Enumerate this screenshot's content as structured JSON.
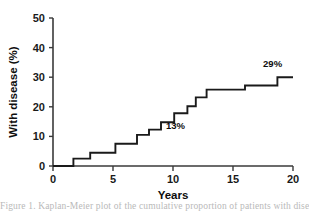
{
  "chart_data": {
    "type": "line",
    "subtype": "step",
    "title": "",
    "xlabel": "Years",
    "ylabel": "With disease (%)",
    "xlim": [
      0,
      20
    ],
    "ylim": [
      0,
      50
    ],
    "xticks": [
      0,
      5,
      10,
      15,
      20
    ],
    "yticks": [
      0,
      10,
      20,
      30,
      40,
      50
    ],
    "xtick_labels": [
      "0",
      "5",
      "10",
      "15",
      "20"
    ],
    "ytick_labels": [
      "0",
      "10",
      "20",
      "30",
      "40",
      "50"
    ],
    "grid": false,
    "legend": false,
    "line_color": "#1a1a1a",
    "axis_color": "#3a3a3a",
    "background": "#ffffff",
    "series": [
      {
        "name": "Cumulative incidence of disease",
        "step_mode": "post",
        "x": [
          0,
          1.7,
          3.1,
          5.2,
          7.0,
          8.0,
          9.0,
          10.1,
          11.2,
          11.9,
          12.8,
          16.0,
          18.7,
          20.0
        ],
        "y": [
          0,
          2.5,
          4.5,
          7.5,
          10.5,
          12.3,
          14.8,
          17.8,
          20.2,
          23.2,
          25.8,
          27.2,
          30.0,
          30.0
        ]
      }
    ],
    "annotations": [
      {
        "text": "13%",
        "x": 10.2,
        "y": 12.5,
        "name": "annotation-13-percent"
      },
      {
        "text": "29%",
        "x": 18.3,
        "y": 33.5,
        "name": "annotation-29-percent"
      }
    ]
  },
  "caption": {
    "text": "Figure 1. Kaplan-Meier plot of the cumulative proportion of patients with disease"
  }
}
